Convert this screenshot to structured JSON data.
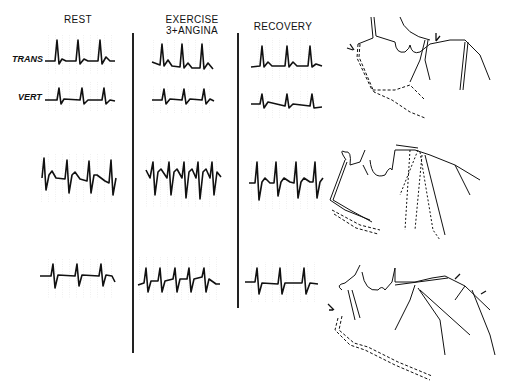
{
  "figure": {
    "columns": [
      {
        "label_line1": "REST",
        "label_line2": ""
      },
      {
        "label_line1": "EXERCISE",
        "label_line2": "3+ANGINA"
      },
      {
        "label_line1": "RECOVERY",
        "label_line2": ""
      }
    ],
    "leads": [
      {
        "label": "TRANS"
      },
      {
        "label": "VERT"
      }
    ],
    "rows": [
      {
        "name": "row-1",
        "panels": [
          "rest-trans",
          "exercise-trans",
          "recovery-trans"
        ],
        "diagram": "coronary-diagram-1"
      },
      {
        "name": "row-2",
        "panels": [
          "rest",
          "exercise",
          "recovery"
        ],
        "diagram": "coronary-diagram-2"
      },
      {
        "name": "row-3",
        "panels": [
          "rest",
          "exercise",
          "recovery"
        ],
        "diagram": "coronary-diagram-3"
      }
    ],
    "colors": {
      "ink": "#111111",
      "grid": "#bbbbbb",
      "background": "#ffffff"
    }
  }
}
